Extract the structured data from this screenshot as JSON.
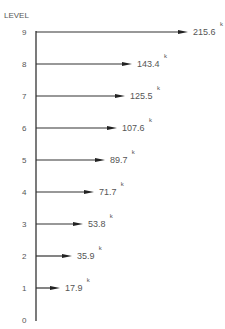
{
  "axis": {
    "title": "LEVEL"
  },
  "levels": [
    {
      "level": "0",
      "y": 320
    },
    {
      "level": "1",
      "y": 288,
      "value": "17.9",
      "unit": "k",
      "tip": 60
    },
    {
      "level": "2",
      "y": 256,
      "value": "35.9",
      "unit": "k",
      "tip": 72
    },
    {
      "level": "3",
      "y": 224,
      "value": "53.8",
      "unit": "k",
      "tip": 83
    },
    {
      "level": "4",
      "y": 192,
      "value": "71.7",
      "unit": "k",
      "tip": 94
    },
    {
      "level": "5",
      "y": 160,
      "value": "89.7",
      "unit": "k",
      "tip": 105
    },
    {
      "level": "6",
      "y": 128,
      "value": "107.6",
      "unit": "k",
      "tip": 117
    },
    {
      "level": "7",
      "y": 96,
      "value": "125.5",
      "unit": "k",
      "tip": 125
    },
    {
      "level": "8",
      "y": 64,
      "value": "143.4",
      "unit": "k",
      "tip": 132
    },
    {
      "level": "9",
      "y": 32,
      "value": "215.6",
      "unit": "k",
      "tip": 188
    }
  ],
  "chart_data": {
    "type": "bar",
    "title": "",
    "ylabel": "LEVEL",
    "categories": [
      "1",
      "2",
      "3",
      "4",
      "5",
      "6",
      "7",
      "8",
      "9"
    ],
    "values": [
      17.9,
      35.9,
      53.8,
      71.7,
      89.7,
      107.6,
      125.5,
      143.4,
      215.6
    ],
    "unit": "k"
  }
}
